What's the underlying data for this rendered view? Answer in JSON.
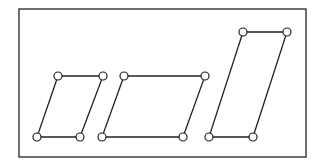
{
  "diagram": {
    "colors": {
      "stroke": "#222222",
      "node_fill": "#ffffff",
      "background": "#ffffff"
    },
    "frame": {
      "x": 19,
      "y": 9,
      "width": 287,
      "height": 148
    },
    "node_radius": 4,
    "shapes": [
      {
        "name": "parallelogram-small",
        "points": [
          [
            58,
            76
          ],
          [
            103,
            76
          ],
          [
            80,
            137
          ],
          [
            37,
            137
          ]
        ]
      },
      {
        "name": "parallelogram-wide",
        "points": [
          [
            124,
            76
          ],
          [
            205,
            76
          ],
          [
            183,
            137
          ],
          [
            102,
            137
          ]
        ]
      },
      {
        "name": "parallelogram-tall",
        "points": [
          [
            243,
            32
          ],
          [
            287,
            32
          ],
          [
            253,
            137
          ],
          [
            209,
            137
          ]
        ]
      }
    ]
  }
}
